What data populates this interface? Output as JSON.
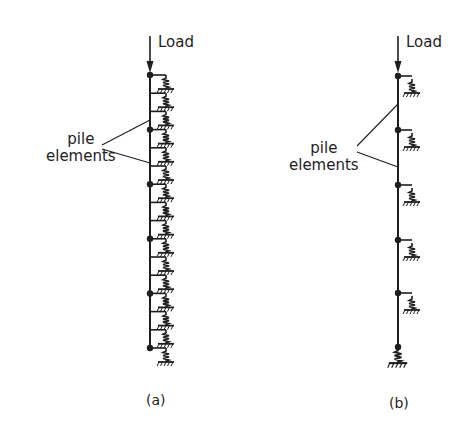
{
  "figure": {
    "panel_a": {
      "load_label": "Load",
      "annotation_label_line1": "pile",
      "annotation_label_line2": "elements",
      "caption": "(a)",
      "spring_count": 15,
      "node_count": 6
    },
    "panel_b": {
      "load_label": "Load",
      "annotation_label_line1": "pile",
      "annotation_label_line2": "elements",
      "caption": "(b)",
      "spring_count": 6,
      "node_count": 6
    },
    "colors": {
      "ink": "#1e1e1e",
      "background": "#ffffff"
    }
  }
}
